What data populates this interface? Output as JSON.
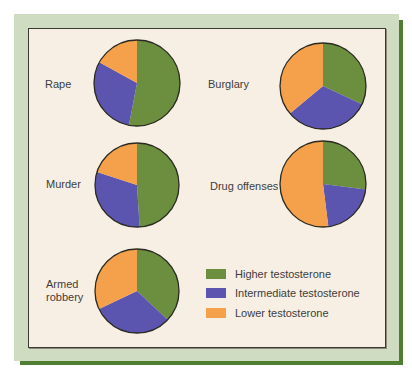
{
  "chart_data": {
    "type": "pie",
    "title": "",
    "legend": {
      "position": "bottom-right",
      "entries": [
        {
          "key": "higher",
          "label": "Higher testosterone",
          "color": "#6b8f3e"
        },
        {
          "key": "intermediate",
          "label": "Intermediate testosterone",
          "color": "#5b55b0"
        },
        {
          "key": "lower",
          "label": "Lower testosterone",
          "color": "#f5a04a"
        }
      ]
    },
    "series_order": [
      "higher",
      "intermediate",
      "lower"
    ],
    "pies": [
      {
        "label": "Rape",
        "label_lines": [
          "Rape"
        ],
        "values": {
          "higher": 53,
          "intermediate": 30,
          "lower": 17
        },
        "cx": 137,
        "cy": 83,
        "r": 43,
        "label_x": 45,
        "label_y": 78
      },
      {
        "label": "Burglary",
        "label_lines": [
          "Burglary"
        ],
        "values": {
          "higher": 32,
          "intermediate": 32,
          "lower": 36
        },
        "cx": 323,
        "cy": 86,
        "r": 43,
        "label_x": 208,
        "label_y": 78
      },
      {
        "label": "Murder",
        "label_lines": [
          "Murder"
        ],
        "values": {
          "higher": 49,
          "intermediate": 31,
          "lower": 20
        },
        "cx": 137,
        "cy": 185,
        "r": 42,
        "label_x": 46,
        "label_y": 178
      },
      {
        "label": "Drug offenses",
        "label_lines": [
          "Drug offenses"
        ],
        "values": {
          "higher": 27,
          "intermediate": 21,
          "lower": 52
        },
        "cx": 323,
        "cy": 184,
        "r": 43,
        "label_x": 210,
        "label_y": 180
      },
      {
        "label": "Armed robbery",
        "label_lines": [
          "Armed",
          "robbery"
        ],
        "values": {
          "higher": 37,
          "intermediate": 31,
          "lower": 32
        },
        "cx": 137,
        "cy": 291,
        "r": 42,
        "label_x": 46,
        "label_y": 278
      }
    ],
    "units": "percent of offenders"
  },
  "colors": {
    "frame": "#cfdcc2",
    "frame_shadow": "#4f7d32",
    "panel": "#f7efe3",
    "outline": "#2a2a22"
  }
}
